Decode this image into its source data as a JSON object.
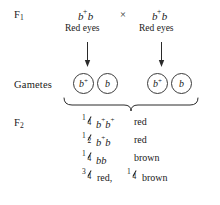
{
  "diagram": {
    "background_color": "#ffffff",
    "text_color": "#1a1a1a"
  },
  "stages": {
    "f1_label": "F",
    "f1_sub": "1",
    "gametes_label": "Gametes",
    "f2_label": "F",
    "f2_sub": "2"
  },
  "f1_cross": {
    "cross_symbol": "×",
    "parent1": {
      "allele1": "b",
      "allele1_sup": "+",
      "allele2": "b",
      "phenotype": "Red eyes"
    },
    "parent2": {
      "allele1": "b",
      "allele1_sup": "+",
      "allele2": "b",
      "phenotype": "Red eyes"
    }
  },
  "gametes": [
    {
      "allele": "b",
      "sup": "+"
    },
    {
      "allele": "b",
      "sup": ""
    },
    {
      "allele": "b",
      "sup": "+"
    },
    {
      "allele": "b",
      "sup": ""
    }
  ],
  "f2_results": [
    {
      "numerator": "1",
      "denominator": "4",
      "genotype_a": "b",
      "genotype_a_sup": "+",
      "genotype_b": "b",
      "genotype_b_sup": "+",
      "phenotype": "red"
    },
    {
      "numerator": "1",
      "denominator": "2",
      "genotype_a": "b",
      "genotype_a_sup": "+",
      "genotype_b": "b",
      "genotype_b_sup": "",
      "phenotype": "red"
    },
    {
      "numerator": "1",
      "denominator": "4",
      "genotype_a": "b",
      "genotype_a_sup": "",
      "genotype_b": "b",
      "genotype_b_sup": "",
      "phenotype": "brown"
    }
  ],
  "f2_summary": {
    "first_numerator": "3",
    "first_denominator": "4",
    "first_text": "red,",
    "second_numerator": "1",
    "second_denominator": "4",
    "second_text": "brown"
  }
}
